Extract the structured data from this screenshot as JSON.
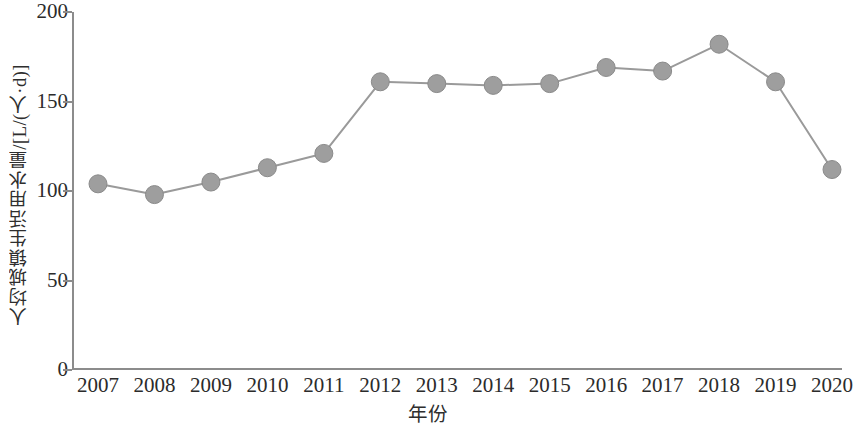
{
  "chart_data": {
    "type": "line",
    "title": "",
    "xlabel": "年份",
    "ylabel": "人均城镇生活用水量/[L/(人·d)]",
    "categories": [
      "2007",
      "2008",
      "2009",
      "2010",
      "2011",
      "2012",
      "2013",
      "2014",
      "2015",
      "2016",
      "2017",
      "2018",
      "2019",
      "2020"
    ],
    "values": [
      104,
      98,
      105,
      113,
      121,
      161,
      160,
      159,
      160,
      169,
      167,
      182,
      161,
      112
    ],
    "series": [
      {
        "name": "人均城镇生活用水量",
        "values": [
          104,
          98,
          105,
          113,
          121,
          161,
          160,
          159,
          160,
          169,
          167,
          182,
          161,
          112
        ]
      }
    ],
    "ylim": [
      0,
      200
    ],
    "y_ticks": [
      0,
      50,
      100,
      150,
      200
    ],
    "y_tick_labels": [
      "0",
      "50",
      "100",
      "150",
      "200"
    ],
    "x_tick_labels": [
      "2007",
      "2008",
      "2009",
      "2010",
      "2011",
      "2012",
      "2013",
      "2014",
      "2015",
      "2016",
      "2017",
      "2018",
      "2019",
      "2020"
    ],
    "grid": false,
    "legend": false,
    "legend_position": "none",
    "line_color": "#9a9a9a",
    "marker_color": "#9e9e9e",
    "marker_edge_color": "#8a8a8a",
    "axis_color": "#8c8c8c",
    "background_color": "#ffffff",
    "marker": "circle",
    "marker_size": 9,
    "line_width": 2
  }
}
